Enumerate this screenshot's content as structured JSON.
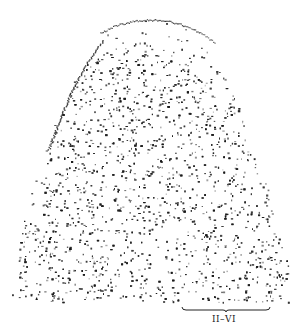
{
  "figure": {
    "type": "stippled histological section drawing",
    "ink_color": "#1a1a1a",
    "background": "#ffffff",
    "outline": {
      "top_y": 14,
      "bottom_y": 302,
      "left_x_bottom": 14,
      "right_x_bottom": 292,
      "apex_x": 150
    },
    "layers": [
      {
        "name": "outer-sparse-layer",
        "density": 0.25
      },
      {
        "name": "dense-cortex",
        "density": 0.75
      },
      {
        "name": "radial-fibers",
        "density": 0.55
      }
    ]
  },
  "scale_bracket": {
    "label": "II–VI",
    "x1": 182,
    "x2": 270,
    "y": 310
  }
}
